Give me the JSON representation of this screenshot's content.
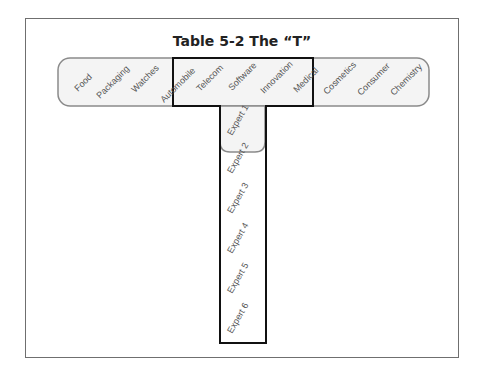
{
  "title": "Table 5-2  The “T”",
  "horizontal_bar": {
    "labels": [
      "Food",
      "Packaging",
      "Watches",
      "Automobile",
      "Telecom",
      "Software",
      "Innovation",
      "Medical",
      "Cosmetics",
      "Consumer",
      "Chemistry"
    ]
  },
  "vertical_bar": {
    "labels": [
      "Expert 1",
      "Expert 2",
      "Expert 3",
      "Expert 4",
      "Expert 5",
      "Expert 6"
    ]
  },
  "colors": {
    "frame": "#6f6f6f",
    "rounded_fill": "#f4f4f4",
    "rounded_stroke": "#8a8a8a",
    "t_outline": "#111111",
    "text": "#555555"
  }
}
